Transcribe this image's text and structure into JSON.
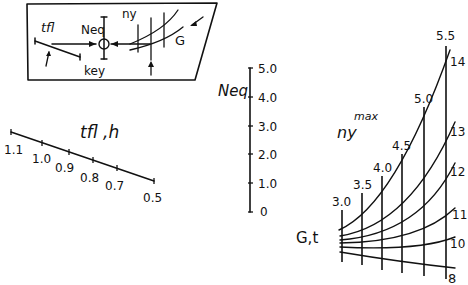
{
  "key_box": {
    "labels": {
      "tfl": "tfl",
      "neq": "Neq",
      "ny": "ny",
      "g": "G",
      "key": "key"
    }
  },
  "tfl_scale": {
    "title": "tfl ,h",
    "ticks": [
      "1.1",
      "1.0",
      "0.9",
      "0.8",
      "0.7",
      "0.5"
    ]
  },
  "neq_scale": {
    "title": "Neq",
    "ticks": [
      "5.0",
      "4.0",
      "3.0",
      "2.0",
      "1.0",
      "0"
    ]
  },
  "ny_grid": {
    "title_main": "ny",
    "title_sup": "max",
    "g_label": "G,t",
    "ny_values": [
      "3.0",
      "3.5",
      "4.0",
      "4.5",
      "5.0",
      "5.5"
    ],
    "g_values": [
      "14",
      "13",
      "12",
      "11",
      "10",
      "8"
    ]
  }
}
